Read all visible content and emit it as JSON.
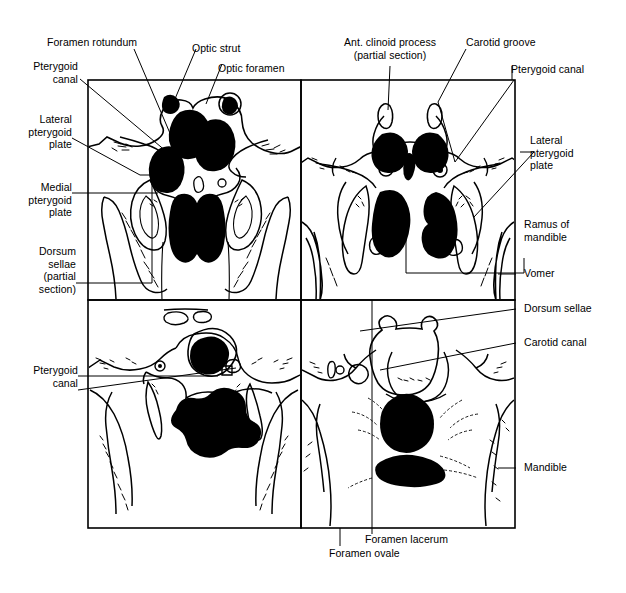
{
  "figure": {
    "kind": "anatomical-line-diagram",
    "panel_count": 4,
    "ink_color": "#000000",
    "background_color": "#ffffff",
    "labels": [
      {
        "id": "foramen-rotundum",
        "text": "Foramen rotundum",
        "align": "l"
      },
      {
        "id": "optic-strut",
        "text": "Optic strut",
        "align": "l"
      },
      {
        "id": "optic-foramen",
        "text": "Optic foramen",
        "align": "l"
      },
      {
        "id": "pterygoid-canal-top-left",
        "text": "Pterygoid\ncanal",
        "align": "r"
      },
      {
        "id": "lateral-pterygoid-plate-left",
        "text": "Lateral\npterygoid\nplate",
        "align": "r"
      },
      {
        "id": "medial-pterygoid-plate",
        "text": "Medial\npterygoid\nplate",
        "align": "r"
      },
      {
        "id": "dorsum-sellae-partial-section",
        "text": "Dorsum\nsellae\n(partial\nsection)",
        "align": "r"
      },
      {
        "id": "pterygoid-canal-bottom-left",
        "text": "Pterygoid\ncanal",
        "align": "r"
      },
      {
        "id": "ant-clinoid-process",
        "text": "Ant. clinoid process\n(partial section)",
        "align": "c"
      },
      {
        "id": "carotid-groove",
        "text": "Carotid groove",
        "align": "l"
      },
      {
        "id": "pterygoid-canal-top-right",
        "text": "Pterygoid canal",
        "align": "l"
      },
      {
        "id": "lateral-pterygoid-plate-right",
        "text": "Lateral\npterygoid\nplate",
        "align": "l"
      },
      {
        "id": "ramus-of-mandible",
        "text": "Ramus of\nmandible",
        "align": "l"
      },
      {
        "id": "vomer",
        "text": "Vomer",
        "align": "l"
      },
      {
        "id": "dorsum-sellae",
        "text": "Dorsum sellae",
        "align": "l"
      },
      {
        "id": "carotid-canal",
        "text": "Carotid canal",
        "align": "l"
      },
      {
        "id": "mandible",
        "text": "Mandible",
        "align": "l"
      },
      {
        "id": "foramen-lacerum",
        "text": "Foramen lacerum",
        "align": "l"
      },
      {
        "id": "foramen-ovale",
        "text": "Foramen ovale",
        "align": "l"
      }
    ]
  }
}
